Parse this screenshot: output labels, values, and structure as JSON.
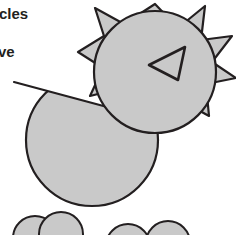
{
  "canvas": {
    "width": 236,
    "height": 235,
    "background_color": "#ffffff"
  },
  "style": {
    "shape_fill": "#c9c9c9",
    "shape_stroke": "#231f20",
    "stroke_width": 2,
    "text_color": "#231f20"
  },
  "labels": {
    "line1": "cles",
    "line2": "ve"
  },
  "shapes": [
    {
      "name": "spiked-star",
      "type": "polygon",
      "fill": "#c9c9c9",
      "points": "155,4 178,28 205,6 201,40 232,36 212,62 236,78 206,84 209,116 180,100 167,126 150,104 124,120 122,88 90,96 103,68 78,52 104,36 95,8 124,24"
    },
    {
      "name": "head-circle",
      "type": "circle",
      "fill": "#c9c9c9",
      "cx": 155,
      "cy": 72,
      "r": 61
    },
    {
      "name": "eye-triangle",
      "type": "polygon",
      "fill": "none",
      "points": "149,65 185,47 178,80"
    },
    {
      "name": "body-circle-clipped",
      "type": "circle-chord",
      "fill": "#c9c9c9",
      "cx": 92,
      "cy": 140,
      "r": 66,
      "chord_start": "14,82",
      "chord_end": "178,126"
    },
    {
      "name": "foot-left-circle-a",
      "type": "circle",
      "fill": "#c9c9c9",
      "cx": 35,
      "cy": 238,
      "r": 22
    },
    {
      "name": "foot-left-circle-b",
      "type": "circle",
      "fill": "#c9c9c9",
      "cx": 61,
      "cy": 234,
      "r": 22
    },
    {
      "name": "foot-right-circle-a",
      "type": "circle",
      "fill": "#c9c9c9",
      "cx": 128,
      "cy": 246,
      "r": 22
    },
    {
      "name": "foot-right-circle-b",
      "type": "circle",
      "fill": "#c9c9c9",
      "cx": 168,
      "cy": 243,
      "r": 22
    }
  ]
}
